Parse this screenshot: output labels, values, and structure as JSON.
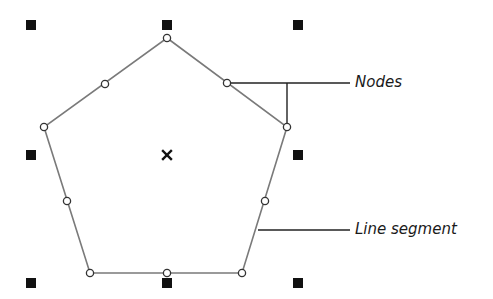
{
  "diagram": {
    "title": "",
    "labels": {
      "nodes": "Nodes",
      "line_segment": "Line segment"
    },
    "colors": {
      "outline": "#7a7a7a",
      "node_stroke": "#333333",
      "handle": "#111111",
      "leader": "#222222",
      "background": "#ffffff"
    },
    "shape": {
      "type": "pentagon",
      "vertices": [
        [
          167,
          38
        ],
        [
          287,
          127
        ],
        [
          242,
          273
        ],
        [
          90,
          273
        ],
        [
          44,
          127
        ]
      ],
      "nodes": [
        [
          167,
          38
        ],
        [
          227,
          83
        ],
        [
          287,
          127
        ],
        [
          265,
          201
        ],
        [
          242,
          273
        ],
        [
          167,
          273
        ],
        [
          90,
          273
        ],
        [
          67,
          201
        ],
        [
          44,
          127
        ],
        [
          105,
          84
        ]
      ],
      "center_marker": [
        167,
        155
      ]
    },
    "selection_handles": [
      [
        31,
        25
      ],
      [
        167,
        25
      ],
      [
        298,
        25
      ],
      [
        31,
        155
      ],
      [
        298,
        155
      ],
      [
        31,
        283
      ],
      [
        167,
        283
      ],
      [
        298,
        283
      ]
    ]
  }
}
